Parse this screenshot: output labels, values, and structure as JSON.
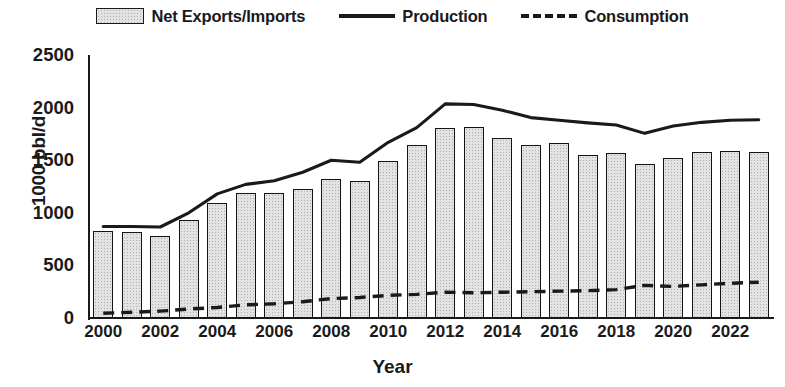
{
  "legend": {
    "items": [
      {
        "label": "Net Exports/Imports",
        "marker": "bar-swatch-icon"
      },
      {
        "label": "Production",
        "marker": "solid-line-icon"
      },
      {
        "label": "Consumption",
        "marker": "dashed-line-icon"
      }
    ]
  },
  "axes": {
    "y_title": "1000 bbl/d",
    "x_title": "Year",
    "y_ticks": [
      "0",
      "500",
      "1000",
      "1500",
      "2000",
      "2500"
    ],
    "x_ticks": [
      "2000",
      "2002",
      "2004",
      "2006",
      "2008",
      "2010",
      "2012",
      "2014",
      "2016",
      "2018",
      "2020",
      "2022"
    ]
  },
  "colors": {
    "bar_fill": "#e3e3e3",
    "bar_border": "#141414",
    "line": "#1a1a1a",
    "background": "#ffffff"
  },
  "chart_data": {
    "type": "bar",
    "title": "",
    "subtitle": "",
    "xlabel": "Year",
    "ylabel": "1000 bbl/d",
    "ylim": [
      0,
      2500
    ],
    "ytick_step": 500,
    "grid": false,
    "legend_position": "top-center",
    "categories": [
      2000,
      2001,
      2002,
      2003,
      2004,
      2005,
      2006,
      2007,
      2008,
      2009,
      2010,
      2011,
      2012,
      2013,
      2014,
      2015,
      2016,
      2017,
      2018,
      2019,
      2020,
      2021,
      2022,
      2023
    ],
    "series": [
      {
        "name": "Net Exports/Imports",
        "type": "bar",
        "values": [
          830,
          820,
          780,
          930,
          1090,
          1185,
          1185,
          1225,
          1320,
          1305,
          1495,
          1645,
          1805,
          1815,
          1710,
          1645,
          1660,
          1550,
          1570,
          1465,
          1525,
          1575,
          1585,
          1580
        ]
      },
      {
        "name": "Production",
        "type": "line",
        "style": "solid",
        "values": [
          870,
          870,
          865,
          1000,
          1180,
          1270,
          1305,
          1385,
          1500,
          1480,
          1670,
          1810,
          2035,
          2030,
          1975,
          1905,
          1880,
          1855,
          1835,
          1755,
          1825,
          1860,
          1880,
          1885
        ]
      },
      {
        "name": "Consumption",
        "type": "line",
        "style": "dashed",
        "values": [
          45,
          55,
          65,
          85,
          100,
          125,
          135,
          155,
          185,
          195,
          215,
          225,
          245,
          240,
          245,
          250,
          255,
          260,
          270,
          310,
          300,
          315,
          330,
          340
        ]
      }
    ]
  }
}
